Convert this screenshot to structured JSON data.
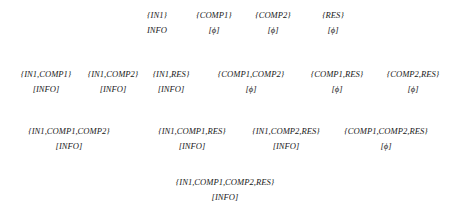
{
  "diagram": {
    "type": "subset-lattice",
    "rows": [
      {
        "level": 1,
        "nodes": [
          {
            "set": "{IN1}",
            "value": "INFO",
            "x": 157,
            "y": 8
          },
          {
            "set": "{COMP1}",
            "value": "[ϕ]",
            "x": 214,
            "y": 8
          },
          {
            "set": "{COMP2}",
            "value": "[ϕ]",
            "x": 273,
            "y": 8
          },
          {
            "set": "{RES}",
            "value": "[ϕ]",
            "x": 333,
            "y": 8
          }
        ]
      },
      {
        "level": 2,
        "nodes": [
          {
            "set": "{IN1,COMP1}",
            "value": "[INFO]",
            "x": 46,
            "y": 67
          },
          {
            "set": "{IN1,COMP2}",
            "value": "[INFO]",
            "x": 113,
            "y": 67
          },
          {
            "set": "{IN1,RES}",
            "value": "[INFO]",
            "x": 171,
            "y": 67
          },
          {
            "set": "{COMP1,COMP2}",
            "value": "[ϕ]",
            "x": 251,
            "y": 67
          },
          {
            "set": "{COMP1,RES}",
            "value": "[ϕ]",
            "x": 337,
            "y": 67
          },
          {
            "set": "{COMP2,RES}",
            "value": "[ϕ]",
            "x": 413,
            "y": 67
          }
        ]
      },
      {
        "level": 3,
        "nodes": [
          {
            "set": "{IN1,COMP1,COMP2}",
            "value": "[INFO]",
            "x": 69,
            "y": 124
          },
          {
            "set": "{IN1,COMP1,RES}",
            "value": "[INFO]",
            "x": 192,
            "y": 124
          },
          {
            "set": "{IN1,COMP2,RES}",
            "value": "[INFO]",
            "x": 286,
            "y": 124
          },
          {
            "set": "{COMP1,COMP2,RES}",
            "value": "[ϕ]",
            "x": 386,
            "y": 124
          }
        ]
      },
      {
        "level": 4,
        "nodes": [
          {
            "set": "{IN1,COMP1,COMP2,RES}",
            "value": "[INFO]",
            "x": 225,
            "y": 175
          }
        ]
      }
    ]
  }
}
